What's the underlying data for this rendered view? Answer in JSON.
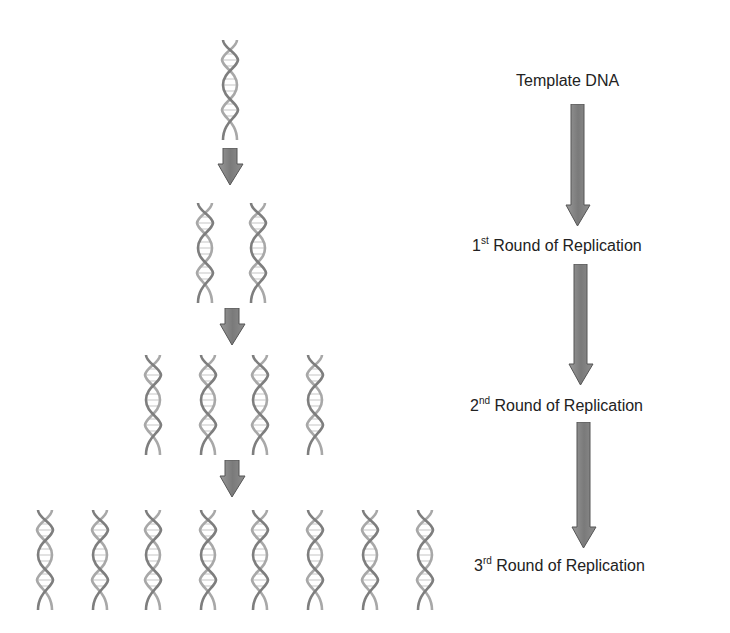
{
  "colors": {
    "background": "#ffffff",
    "arrow_fill": "#7a7a7a",
    "arrow_stroke": "#555555",
    "helix_strand": "#8c8c8c",
    "helix_rung": "#d4d4d4",
    "text": "#222222"
  },
  "diagram": {
    "generations": [
      {
        "name": "template",
        "helix_count": 1
      },
      {
        "name": "round-1",
        "helix_count": 2
      },
      {
        "name": "round-2",
        "helix_count": 4
      },
      {
        "name": "round-3",
        "helix_count": 8
      }
    ]
  },
  "labels": {
    "template": {
      "text": "Template DNA"
    },
    "round1": {
      "num": "1",
      "suffix": "st",
      "text": " Round of Replication"
    },
    "round2": {
      "num": "2",
      "suffix": "nd",
      "text": " Round of Replication"
    },
    "round3": {
      "num": "3",
      "suffix": "rd",
      "text": " Round of Replication"
    }
  }
}
